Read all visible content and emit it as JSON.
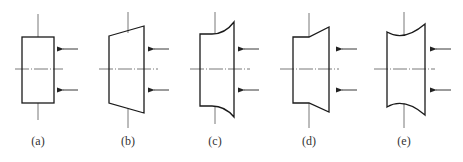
{
  "figure": {
    "panels": [
      {
        "id": "a",
        "label": "(a)",
        "profile": "rectangle"
      },
      {
        "id": "b",
        "label": "(b)",
        "profile": "trapezoid-flared-right"
      },
      {
        "id": "c",
        "label": "(c)",
        "profile": "concave-curve-flared-right"
      },
      {
        "id": "d",
        "label": "(d)",
        "profile": "step-then-taper-right"
      },
      {
        "id": "e",
        "label": "(e)",
        "profile": "concave-both-ends"
      }
    ],
    "arrow_icon": "arrow-left-icon",
    "colors": {
      "line": "#1a1a1a",
      "axis": "#555555",
      "background": "#ffffff"
    }
  }
}
